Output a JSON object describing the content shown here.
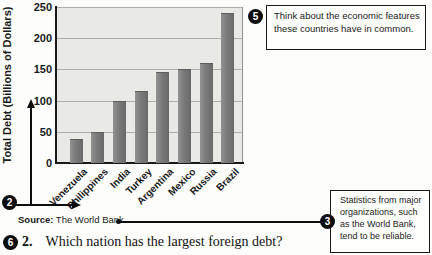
{
  "chart_data": {
    "type": "bar",
    "categories": [
      "Venezuela",
      "Philippines",
      "India",
      "Turkey",
      "Argentina",
      "Mexico",
      "Russia",
      "Brazil"
    ],
    "values": [
      38,
      50,
      100,
      116,
      146,
      150,
      160,
      240
    ],
    "title": "",
    "xlabel": "",
    "ylabel": "Total Debt (Billions of Dollars)",
    "ylim": [
      0,
      250
    ],
    "yticks": [
      0,
      50,
      100,
      150,
      200,
      250
    ],
    "grid": true,
    "legend": "none",
    "source": "The World Bank"
  },
  "source": {
    "label": "Source:",
    "value": "The World Bank"
  },
  "callouts": {
    "axes": {
      "number": "2"
    },
    "think": {
      "number": "5",
      "text": "Think about the economic features these countries have in common."
    },
    "stats": {
      "number": "3",
      "text": "Statistics from major organizations, such as the World Bank, tend to be reliable."
    },
    "question_marker": {
      "number": "6"
    }
  },
  "question": {
    "number": "2.",
    "text": "Which nation has the largest foreign debt?"
  },
  "colors": {
    "bar": "#7a7a7a",
    "plot_background": "#e9e9e5",
    "gridline": "#adadaa",
    "accent_black": "#0d0d0d"
  }
}
